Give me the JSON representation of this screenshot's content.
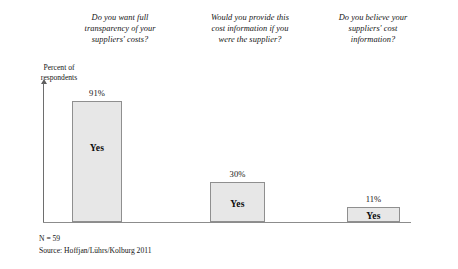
{
  "chart_data": {
    "type": "bar",
    "title": "",
    "subtitle": "",
    "xlabel": "",
    "ylabel": "Percent of respondents",
    "ylim": [
      0,
      100
    ],
    "grid": false,
    "legend": "none",
    "orientation": "vertical",
    "categories": [
      "Do you want full transparency of your suppliers' costs?",
      "Would you provide this cost information if you were the supplier?",
      "Do you believe your suppliers' cost information?"
    ],
    "values": [
      91,
      30,
      11
    ],
    "value_labels": [
      "91%",
      "30%",
      "11%"
    ],
    "bar_labels": [
      "Yes",
      "Yes",
      "Yes"
    ],
    "series": [
      {
        "name": "Yes",
        "values": [
          91,
          30,
          11
        ]
      }
    ],
    "annotations": {
      "sample_size": "N = 59",
      "source": "Source: Hoffjan/Lührs/Kolburg 2011"
    },
    "colors": {
      "bar_fill": "#e7e7e7",
      "bar_border": "#8f8f8f",
      "axis": "#8c8c8c",
      "text": "#141414"
    }
  },
  "questions": [
    {
      "id": "q1",
      "line1": "Do you want full",
      "line2": "transparency of your",
      "line3": "suppliers' costs?"
    },
    {
      "id": "q2",
      "line1": "Would you provide this",
      "line2": "cost information if you",
      "line3": "were the supplier?"
    },
    {
      "id": "q3",
      "line1": "Do you believe your",
      "line2": "suppliers' cost",
      "line3": "information?"
    }
  ],
  "axis": {
    "ylabel_line1": "Percent of",
    "ylabel_line2": "respondents"
  },
  "bars": [
    {
      "value_label": "91%",
      "inner_label": "Yes"
    },
    {
      "value_label": "30%",
      "inner_label": "Yes"
    },
    {
      "value_label": "11%",
      "inner_label": "Yes"
    }
  ],
  "footnotes": {
    "sample_size": "N = 59",
    "source": "Source: Hoffjan/Lührs/Kolburg 2011"
  }
}
